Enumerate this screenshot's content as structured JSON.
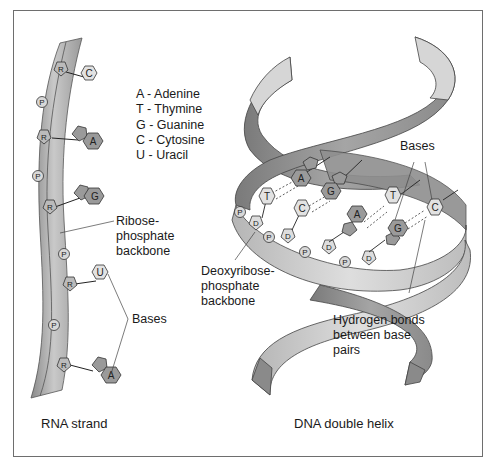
{
  "figure": {
    "rna_caption": "RNA strand",
    "dna_caption": "DNA double helix"
  },
  "key": {
    "items": [
      {
        "letter": "A",
        "text": "A - Adenine"
      },
      {
        "letter": "T",
        "text": "T - Thymine"
      },
      {
        "letter": "G",
        "text": "G - Guanine"
      },
      {
        "letter": "C",
        "text": "C - Cytosine"
      },
      {
        "letter": "U",
        "text": "U - Uracil"
      }
    ]
  },
  "rna": {
    "backbone_label_line1": "Ribose-",
    "backbone_label_line2": "phosphate",
    "backbone_label_line3": "backbone",
    "bases_label": "Bases",
    "sugar_symbol": "R",
    "phosphate_symbol": "P",
    "nucleotides": [
      {
        "sugar": "R",
        "base": "C",
        "base_type": "pyrimidine"
      },
      {
        "sugar": "R",
        "base": "A",
        "base_type": "purine"
      },
      {
        "sugar": "R",
        "base": "G",
        "base_type": "purine"
      },
      {
        "sugar": "R",
        "base": "U",
        "base_type": "pyrimidine"
      },
      {
        "sugar": "R",
        "base": "A",
        "base_type": "purine"
      }
    ]
  },
  "dna": {
    "backbone_label_line1": "Deoxyribose-",
    "backbone_label_line2": "phosphate",
    "backbone_label_line3": "backbone",
    "bases_label": "Bases",
    "hbond_label_line1": "Hydrogen bonds",
    "hbond_label_line2": "between base",
    "hbond_label_line3": "pairs",
    "sugar_symbol": "D",
    "phosphate_symbol": "P",
    "base_pairs": [
      {
        "front": "T",
        "back": "A"
      },
      {
        "front": "C",
        "back": "G"
      },
      {
        "front": "A",
        "back": "T"
      },
      {
        "front": "G",
        "back": "C"
      }
    ]
  },
  "colors": {
    "ribbon_light": "#c8c8c8",
    "ribbon_dark": "#8c8c8c",
    "purine_fill": "#9a9a9a",
    "pyrimidine_fill": "#e2e2e2",
    "outline": "#333333",
    "frame": "#6e6e6e"
  }
}
